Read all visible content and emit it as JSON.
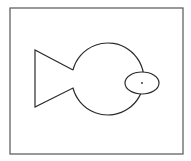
{
  "diagram": {
    "colors": {
      "stroke": "#2a2a2a",
      "frame": "#555555",
      "background": "#ffffff"
    },
    "frame": {
      "x": 10,
      "y": 8,
      "width": 173,
      "height": 146
    },
    "shapes": {
      "tail": {
        "type": "polygon",
        "points": "35,50 73,70 73,88 35,107"
      },
      "body": {
        "type": "circle",
        "cx": 108,
        "cy": 78,
        "r": 36
      },
      "eye": {
        "type": "ellipse",
        "cx": 142,
        "cy": 83,
        "rx": 17,
        "ry": 11
      },
      "pupil": {
        "type": "dot",
        "cx": 142,
        "cy": 83,
        "r": 0.9
      }
    }
  }
}
